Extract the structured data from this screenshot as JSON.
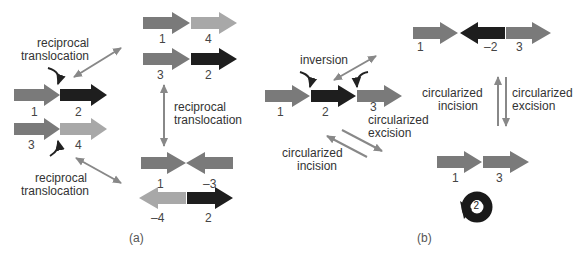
{
  "panel_a": {
    "caption": "(a)",
    "labels": {
      "rt_top": [
        "reciprocal",
        "translocation"
      ],
      "rt_bottom": [
        "reciprocal",
        "translocation"
      ],
      "rt_middle": [
        "reciprocal",
        "translocation"
      ]
    },
    "numbers": {
      "start_row1": [
        "1",
        "2"
      ],
      "start_row2": [
        "3",
        "4"
      ],
      "top_row1": [
        "1",
        "4"
      ],
      "top_row2": [
        "3",
        "2"
      ],
      "bottom_row1": [
        "1",
        "–3"
      ],
      "bottom_row2": [
        "–4",
        "2"
      ]
    }
  },
  "panel_b": {
    "caption": "(b)",
    "labels": {
      "inversion": "inversion",
      "excision_left": [
        "circularized",
        "excision"
      ],
      "incision_left": [
        "circularized",
        "incision"
      ],
      "incision_right": [
        "circularized",
        "incision"
      ],
      "excision_right": [
        "circularized",
        "excision"
      ]
    },
    "numbers": {
      "start": [
        "1",
        "2",
        "3"
      ],
      "inverted": [
        "1",
        "–2",
        "3"
      ],
      "excised": [
        "1",
        "3"
      ],
      "circle": "2"
    }
  },
  "colors": {
    "gray_mid": "#7a7a7a",
    "gray_light": "#a8a8a8",
    "black": "#1e1e1e",
    "arrow_line": "#888888"
  }
}
